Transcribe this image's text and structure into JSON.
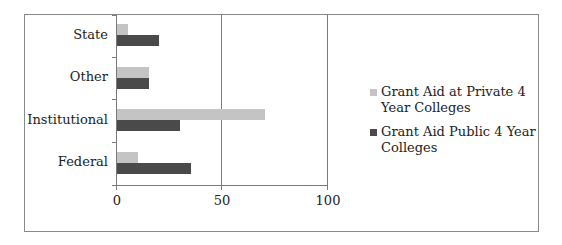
{
  "chart_data": {
    "type": "bar",
    "orientation": "horizontal",
    "title": "",
    "xlabel": "",
    "ylabel": "",
    "categories": [
      "Federal",
      "Institutional",
      "Other",
      "State"
    ],
    "series": [
      {
        "name": "Grant Aid at Private 4 Year Colleges",
        "color": "#c4c4c4",
        "values": [
          10,
          70,
          15,
          5
        ]
      },
      {
        "name": "Grant Aid Public 4 Year Colleges",
        "color": "#4a4a4a",
        "values": [
          35,
          30,
          15,
          20
        ]
      }
    ],
    "xlim": [
      0,
      100
    ],
    "xticks": [
      "0",
      "50",
      "100"
    ],
    "grid": true,
    "legend_position": "right"
  },
  "axis": {
    "cat_labels_top_to_bottom": [
      "State",
      "Other",
      "Institutional",
      "Federal"
    ],
    "x_ticks": [
      "0",
      "50",
      "100"
    ]
  },
  "legend": {
    "items": [
      {
        "label": "Grant Aid at Private 4 Year Colleges",
        "color": "#c4c4c4"
      },
      {
        "label": "Grant Aid Public 4 Year Colleges",
        "color": "#4a4a4a"
      }
    ]
  }
}
